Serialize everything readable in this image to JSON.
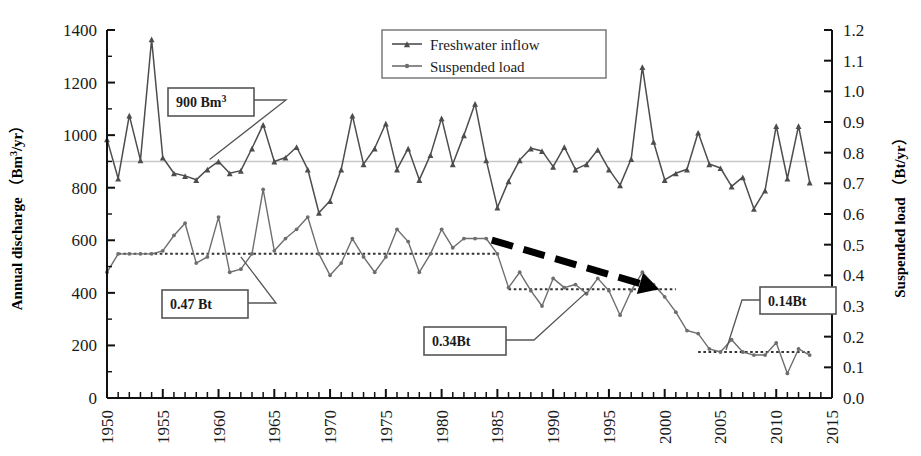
{
  "chart_data": {
    "type": "line",
    "title": "",
    "xlabel": "",
    "ylabel": "Annual discharge",
    "ylabel_unit": "Bm3/yr",
    "y2label": "Suspended load",
    "y2label_unit": "Bt/yr",
    "xlim": [
      1950,
      2015
    ],
    "ylim": [
      0,
      1400
    ],
    "y2lim": [
      0.0,
      1.2
    ],
    "grid": false,
    "legend_position": "top-center",
    "ytick_labels": [
      "0",
      "200",
      "400",
      "600",
      "800",
      "1000",
      "1200",
      "1400"
    ],
    "ytick_values": [
      0,
      200,
      400,
      600,
      800,
      1000,
      1200,
      1400
    ],
    "y2tick_labels": [
      "0.0",
      "0.1",
      "0.2",
      "0.3",
      "0.4",
      "0.5",
      "0.6",
      "0.7",
      "0.8",
      "0.9",
      "1.0",
      "1.1",
      "1.2"
    ],
    "y2tick_values": [
      0.0,
      0.1,
      0.2,
      0.3,
      0.4,
      0.5,
      0.6,
      0.7,
      0.8,
      0.9,
      1.0,
      1.1,
      1.2
    ],
    "xtick_labels": [
      "1950",
      "1955",
      "1960",
      "1965",
      "1970",
      "1975",
      "1980",
      "1985",
      "1990",
      "1995",
      "2000",
      "2005",
      "2010",
      "2015"
    ],
    "xtick_values": [
      1950,
      1955,
      1960,
      1965,
      1970,
      1975,
      1980,
      1985,
      1990,
      1995,
      2000,
      2005,
      2010,
      2015
    ],
    "x": [
      1950,
      1951,
      1952,
      1953,
      1954,
      1955,
      1956,
      1957,
      1958,
      1959,
      1960,
      1961,
      1962,
      1963,
      1964,
      1965,
      1966,
      1967,
      1968,
      1969,
      1970,
      1971,
      1972,
      1973,
      1974,
      1975,
      1976,
      1977,
      1978,
      1979,
      1980,
      1981,
      1982,
      1983,
      1984,
      1985,
      1986,
      1987,
      1988,
      1989,
      1990,
      1991,
      1992,
      1993,
      1994,
      1995,
      1996,
      1997,
      1998,
      1999,
      2000,
      2001,
      2002,
      2003,
      2004,
      2005,
      2006,
      2007,
      2008,
      2009,
      2010,
      2011,
      2012,
      2013
    ],
    "series": [
      {
        "name": "Freshwater inflow",
        "axis": "left",
        "unit": "Bm3/yr",
        "color": "#4d4d4d",
        "marker": "triangle",
        "values": [
          985,
          835,
          1075,
          905,
          1365,
          915,
          855,
          845,
          830,
          870,
          900,
          855,
          865,
          950,
          1040,
          900,
          915,
          955,
          870,
          705,
          750,
          870,
          1075,
          890,
          950,
          1045,
          870,
          950,
          830,
          925,
          1065,
          890,
          1000,
          1120,
          905,
          725,
          825,
          905,
          950,
          940,
          880,
          955,
          870,
          890,
          945,
          870,
          810,
          910,
          1260,
          975,
          830,
          855,
          870,
          1010,
          890,
          875,
          805,
          840,
          720,
          790,
          1035,
          835,
          1035,
          820
        ]
      },
      {
        "name": "Suspended load",
        "axis": "right",
        "unit": "Bt/yr",
        "color": "#6e6e6e",
        "marker": "diamond",
        "values": [
          0.41,
          0.47,
          0.47,
          0.47,
          0.47,
          0.48,
          0.53,
          0.57,
          0.44,
          0.46,
          0.59,
          0.41,
          0.42,
          0.47,
          0.68,
          0.48,
          0.52,
          0.55,
          0.59,
          0.47,
          0.4,
          0.44,
          0.52,
          0.46,
          0.41,
          0.46,
          0.55,
          0.51,
          0.41,
          0.47,
          0.55,
          0.49,
          0.52,
          0.52,
          0.52,
          0.47,
          0.36,
          0.41,
          0.35,
          0.3,
          0.39,
          0.36,
          0.37,
          0.34,
          0.39,
          0.35,
          0.27,
          0.35,
          0.41,
          0.37,
          0.33,
          0.28,
          0.22,
          0.21,
          0.16,
          0.15,
          0.19,
          0.15,
          0.14,
          0.14,
          0.18,
          0.08,
          0.16,
          0.14
        ]
      }
    ],
    "reference_lines": [
      {
        "name": "900 Bm3 mean line",
        "axis": "left",
        "value": 900,
        "style": "solid",
        "color": "#c8c8c8",
        "x_start": 1950,
        "x_end": 2013
      },
      {
        "name": "0.47 Bt mean line",
        "axis": "right",
        "value": 0.47,
        "style": "dotted",
        "color": "#333333",
        "x_start": 1951,
        "x_end": 1985
      },
      {
        "name": "0.34 Bt mean line",
        "axis": "right",
        "value": 0.355,
        "style": "dotted",
        "color": "#333333",
        "x_start": 1986,
        "x_end": 2001
      },
      {
        "name": "0.14 Bt mean line",
        "axis": "right",
        "value": 0.15,
        "style": "dotted",
        "color": "#333333",
        "x_start": 2003,
        "x_end": 2013
      }
    ],
    "annotations": [
      {
        "name": "callout-900",
        "label": "900 Bm",
        "superscript": "3",
        "target_x": 1959.2,
        "target_y_left": 900
      },
      {
        "name": "callout-047",
        "label": "0.47 Bt",
        "superscript": "",
        "target_x": 1962,
        "target_y_right": 0.47
      },
      {
        "name": "callout-034",
        "label": "0.34Bt",
        "superscript": "",
        "target_x": 1993,
        "target_y_right": 0.355
      },
      {
        "name": "callout-014",
        "label": "0.14Bt",
        "superscript": "",
        "target_x": 2005.5,
        "target_y_right": 0.15
      }
    ],
    "trend_arrow": {
      "name": "declining-trend-arrow",
      "style": "thick-dashed",
      "color": "#000000",
      "from": {
        "x": 1984.5,
        "y_right": 0.515
      },
      "to": {
        "x": 1999.5,
        "y_right": 0.355
      }
    }
  },
  "legend": {
    "items": [
      {
        "label": "Freshwater inflow",
        "marker": "triangle",
        "color": "#4d4d4d"
      },
      {
        "label": "Suspended load",
        "marker": "diamond",
        "color": "#6e6e6e"
      }
    ]
  },
  "axes": {
    "left_title_main": "Annual discharge",
    "left_title_open": "（",
    "left_title_unit_base": "Bm",
    "left_title_unit_sup": "3",
    "left_title_unit_tail": "/yr",
    "left_title_close": "）",
    "right_title_main": "Suspended load",
    "right_title_open": "（",
    "right_title_unit": "Bt/yr",
    "right_title_close": "）"
  }
}
